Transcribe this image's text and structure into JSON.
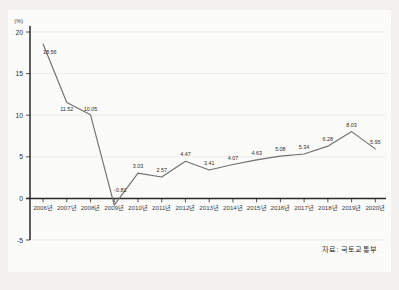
{
  "source_note": "자료: 국토교통부",
  "unit": "(%)",
  "chart_data": {
    "type": "line",
    "title": "",
    "xlabel": "",
    "ylabel": "",
    "unit": "(%)",
    "grid": true,
    "legend": "none",
    "ylim": [
      -5,
      20
    ],
    "yticks": [
      20,
      15,
      10,
      5,
      0,
      -5
    ],
    "ytick_labels": [
      "20",
      "15",
      "10",
      "5",
      "0",
      "-5"
    ],
    "categories": [
      "2006년",
      "2007년",
      "2008년",
      "2009년",
      "2010년",
      "2011년",
      "2012년",
      "2013년",
      "2014년",
      "2015년",
      "2016년",
      "2017년",
      "2018년",
      "2019년",
      "2020년"
    ],
    "values": [
      18.56,
      11.52,
      10.05,
      -0.81,
      3.03,
      2.57,
      4.47,
      3.41,
      4.07,
      4.63,
      5.08,
      5.34,
      6.28,
      8.03,
      5.95
    ],
    "point_labels": [
      "18.56",
      "11.52",
      "10.05",
      "-0.81",
      "3.03",
      "2.57",
      "4.47",
      "3.41",
      "4.07",
      "4.63",
      "5.08",
      "5.34",
      "6.28",
      "8.03",
      "5.95"
    ],
    "series": [
      {
        "name": "연간 증가율",
        "color": "#6f6f6f",
        "values": [
          18.56,
          11.52,
          10.05,
          -0.81,
          3.03,
          2.57,
          4.47,
          3.41,
          4.07,
          4.63,
          5.08,
          5.34,
          6.28,
          8.03,
          5.95
        ]
      }
    ]
  }
}
